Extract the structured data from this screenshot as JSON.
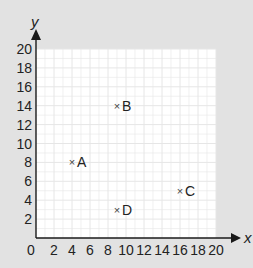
{
  "chart_data": {
    "type": "scatter",
    "title": "",
    "xlabel": "x",
    "ylabel": "y",
    "xlim": [
      0,
      20
    ],
    "ylim": [
      0,
      20
    ],
    "grid": true,
    "x_ticks": [
      0,
      2,
      4,
      6,
      8,
      10,
      12,
      14,
      16,
      18,
      20
    ],
    "y_ticks": [
      2,
      4,
      6,
      8,
      10,
      12,
      14,
      16,
      18,
      20
    ],
    "points": [
      {
        "label": "A",
        "x": 4,
        "y": 8
      },
      {
        "label": "B",
        "x": 9,
        "y": 14
      },
      {
        "label": "C",
        "x": 16,
        "y": 5
      },
      {
        "label": "D",
        "x": 9,
        "y": 3
      }
    ],
    "marker": "×",
    "colors": {
      "background": "#e2e2e2",
      "plot_area": "#ffffff",
      "grid": "#e6e6e6",
      "axis": "#1a1a1a",
      "text": "#222222"
    }
  }
}
